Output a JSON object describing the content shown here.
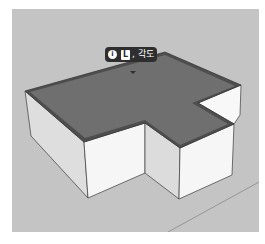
{
  "scene": {
    "colors": {
      "background": "#c4c4c4",
      "roof_face": "#6e6e6e",
      "roof_border": "#4a4a4a",
      "wall_light": "#f4f4f4",
      "wall_shade": "#d9d9d9",
      "edge": "#3a3a3a",
      "axis_line": "#8a8a8a"
    }
  },
  "tooltip": {
    "info_icon": "i",
    "key": "L",
    "label": ", 각도"
  }
}
